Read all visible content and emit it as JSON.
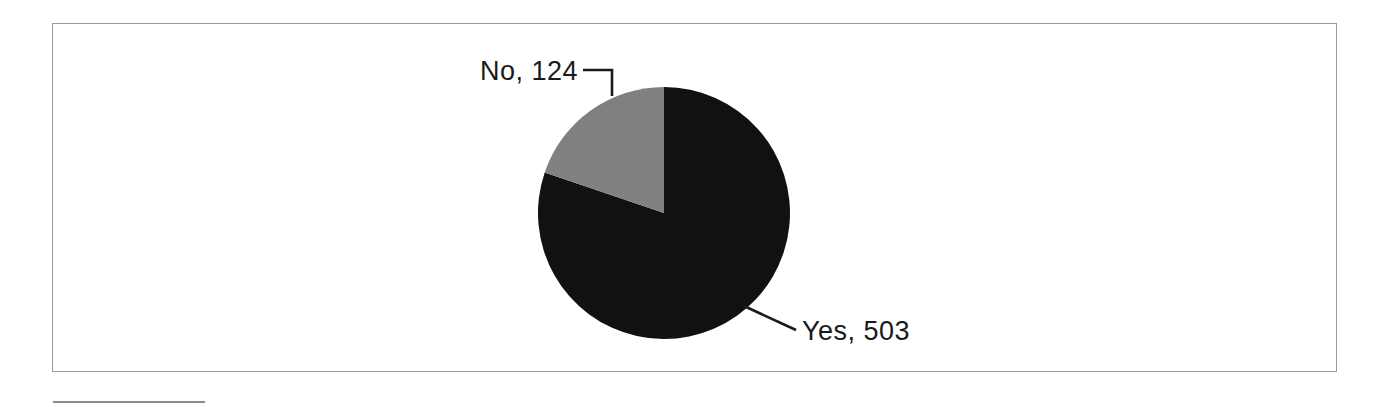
{
  "figure": {
    "frame_border_color": "#9a9a9a",
    "background_color": "#ffffff",
    "bottom_rule_color": "#8d8d8d"
  },
  "chart_data": {
    "type": "pie",
    "title": "",
    "categories": [
      "Yes",
      "No"
    ],
    "values": [
      503,
      124
    ],
    "total": 627,
    "labels": [
      "Yes, 503",
      "No, 124"
    ],
    "percentages": [
      80.2,
      19.8
    ],
    "colors": [
      "#111111",
      "#808080"
    ],
    "legend": "none",
    "grid": false,
    "label_position": "outside-with-leader-lines",
    "start_angle_deg": 0,
    "direction": "clockwise",
    "slices": [
      {
        "name": "Yes",
        "value": 503,
        "label": "Yes, 503",
        "color": "#111111",
        "percent": 80.2,
        "sweep_deg": 288.8
      },
      {
        "name": "No",
        "value": 124,
        "label": "No, 124",
        "color": "#808080",
        "percent": 19.8,
        "sweep_deg": 71.2
      }
    ]
  },
  "annotations": {
    "no_label": "No, 124",
    "yes_label": "Yes, 503"
  }
}
